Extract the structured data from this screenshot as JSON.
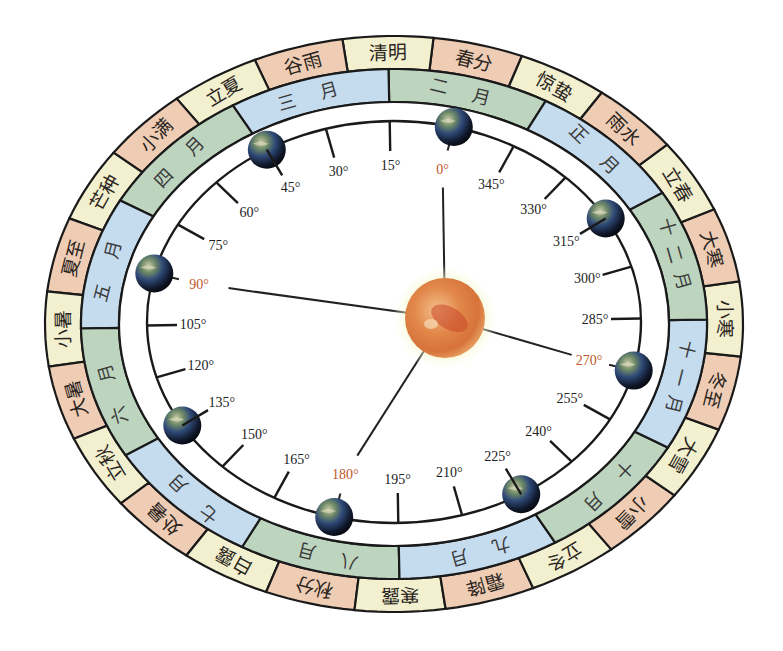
{
  "geometry": {
    "center": [
      394,
      324
    ],
    "outer": {
      "rx": 349,
      "ry": 288
    },
    "term_inner": {
      "rx": 313,
      "ry": 255
    },
    "month_inner": {
      "rx": 275,
      "ry": 222
    },
    "orbit": {
      "rx": 247,
      "ry": 201,
      "cx": 394,
      "cy": 322
    },
    "sun": {
      "cx": 445,
      "cy": 318,
      "r": 40
    }
  },
  "colors": {
    "salmon": "#efcdb5",
    "cream": "#f2f0ce",
    "green": "#bdd4be",
    "blue": "#c5dcef",
    "outline": "#1a1a1a",
    "cardinal_label": "#c0562a",
    "sun_core": "#e08a4a",
    "sun_glow": "#eef3a8"
  },
  "solar_terms": [
    {
      "name": "春分",
      "angle": 0,
      "color": "salmon"
    },
    {
      "name": "清明",
      "angle": 15,
      "color": "cream"
    },
    {
      "name": "谷雨",
      "angle": 30,
      "color": "salmon"
    },
    {
      "name": "立夏",
      "angle": 45,
      "color": "cream"
    },
    {
      "name": "小满",
      "angle": 60,
      "color": "salmon"
    },
    {
      "name": "芒种",
      "angle": 75,
      "color": "cream"
    },
    {
      "name": "夏至",
      "angle": 90,
      "color": "salmon"
    },
    {
      "name": "小暑",
      "angle": 105,
      "color": "cream"
    },
    {
      "name": "大暑",
      "angle": 120,
      "color": "salmon"
    },
    {
      "name": "立秋",
      "angle": 135,
      "color": "cream"
    },
    {
      "name": "处暑",
      "angle": 150,
      "color": "salmon"
    },
    {
      "name": "白露",
      "angle": 165,
      "color": "cream"
    },
    {
      "name": "秋分",
      "angle": 180,
      "color": "salmon"
    },
    {
      "name": "寒露",
      "angle": 195,
      "color": "cream"
    },
    {
      "name": "霜降",
      "angle": 210,
      "color": "salmon"
    },
    {
      "name": "立冬",
      "angle": 225,
      "color": "cream"
    },
    {
      "name": "小雪",
      "angle": 240,
      "color": "salmon"
    },
    {
      "name": "大雪",
      "angle": 255,
      "color": "cream"
    },
    {
      "name": "冬至",
      "angle": 270,
      "color": "salmon"
    },
    {
      "name": "小寒",
      "angle": 285,
      "color": "cream"
    },
    {
      "name": "大寒",
      "angle": 300,
      "color": "salmon"
    },
    {
      "name": "立春",
      "angle": 315,
      "color": "cream"
    },
    {
      "name": "雨水",
      "angle": 330,
      "color": "salmon"
    },
    {
      "name": "惊蛰",
      "angle": 345,
      "color": "cream"
    }
  ],
  "months": [
    {
      "name": "二 月",
      "start": 345,
      "end": 15,
      "color": "green"
    },
    {
      "name": "三 月",
      "start": 15,
      "end": 45,
      "color": "blue"
    },
    {
      "name": "四 月",
      "start": 45,
      "end": 75,
      "color": "green"
    },
    {
      "name": "五 月",
      "start": 75,
      "end": 105,
      "color": "blue"
    },
    {
      "name": "六 月",
      "start": 105,
      "end": 135,
      "color": "green"
    },
    {
      "name": "七 月",
      "start": 135,
      "end": 165,
      "color": "blue"
    },
    {
      "name": "八 月",
      "start": 165,
      "end": 195,
      "color": "green"
    },
    {
      "name": "九 月",
      "start": 195,
      "end": 225,
      "color": "blue"
    },
    {
      "name": "十 月",
      "start": 225,
      "end": 255,
      "color": "green"
    },
    {
      "name": "十一月",
      "start": 255,
      "end": 285,
      "color": "blue"
    },
    {
      "name": "十二月",
      "start": 285,
      "end": 315,
      "color": "green"
    },
    {
      "name": "正 月",
      "start": 315,
      "end": 345,
      "color": "blue"
    }
  ],
  "degree_ticks": [
    {
      "label": "0°",
      "angle": 0,
      "cardinal": true,
      "earth": true
    },
    {
      "label": "15°",
      "angle": 15
    },
    {
      "label": "30°",
      "angle": 30
    },
    {
      "label": "45°",
      "angle": 45,
      "earth": true
    },
    {
      "label": "60°",
      "angle": 60
    },
    {
      "label": "75°",
      "angle": 75
    },
    {
      "label": "90°",
      "angle": 90,
      "cardinal": true,
      "earth": true
    },
    {
      "label": "105°",
      "angle": 105
    },
    {
      "label": "120°",
      "angle": 120
    },
    {
      "label": "135°",
      "angle": 135,
      "earth": true
    },
    {
      "label": "150°",
      "angle": 150
    },
    {
      "label": "165°",
      "angle": 165
    },
    {
      "label": "180°",
      "angle": 180,
      "cardinal": true,
      "earth": true
    },
    {
      "label": "195°",
      "angle": 195
    },
    {
      "label": "210°",
      "angle": 210
    },
    {
      "label": "225°",
      "angle": 225,
      "earth": true
    },
    {
      "label": "240°",
      "angle": 240
    },
    {
      "label": "255°",
      "angle": 255
    },
    {
      "label": "270°",
      "angle": 270,
      "cardinal": true,
      "earth": true
    },
    {
      "label": "285°",
      "angle": 285
    },
    {
      "label": "300°",
      "angle": 300
    },
    {
      "label": "315°",
      "angle": 315,
      "earth": true
    },
    {
      "label": "330°",
      "angle": 330
    },
    {
      "label": "345°",
      "angle": 345
    }
  ],
  "icons": {
    "sun": "sun-icon",
    "earth": "earth-icon"
  }
}
